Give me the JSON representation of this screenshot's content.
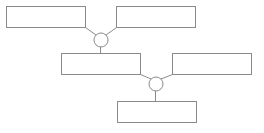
{
  "diagram": {
    "type": "tree-merge",
    "stroke_color": "#8a8a8a",
    "background": "#ffffff",
    "nodes": [
      {
        "id": "box-1",
        "label": "",
        "x": 6,
        "y": 6,
        "w": 79,
        "h": 21
      },
      {
        "id": "box-2",
        "label": "",
        "x": 116,
        "y": 6,
        "w": 79,
        "h": 21
      },
      {
        "id": "box-3",
        "label": "",
        "x": 61,
        "y": 53,
        "w": 79,
        "h": 21
      },
      {
        "id": "box-4",
        "label": "",
        "x": 172,
        "y": 53,
        "w": 79,
        "h": 21
      },
      {
        "id": "box-5",
        "label": "",
        "x": 117,
        "y": 101,
        "w": 79,
        "h": 21
      }
    ],
    "joints": [
      {
        "id": "joint-1",
        "cx": 101,
        "cy": 40,
        "r": 7
      },
      {
        "id": "joint-2",
        "cx": 156,
        "cy": 84,
        "r": 7
      }
    ],
    "edges": [
      {
        "from": "box-1",
        "to": "joint-1"
      },
      {
        "from": "box-2",
        "to": "joint-1"
      },
      {
        "from": "joint-1",
        "to": "box-3"
      },
      {
        "from": "box-3",
        "to": "joint-2"
      },
      {
        "from": "box-4",
        "to": "joint-2"
      },
      {
        "from": "joint-2",
        "to": "box-5"
      }
    ]
  }
}
